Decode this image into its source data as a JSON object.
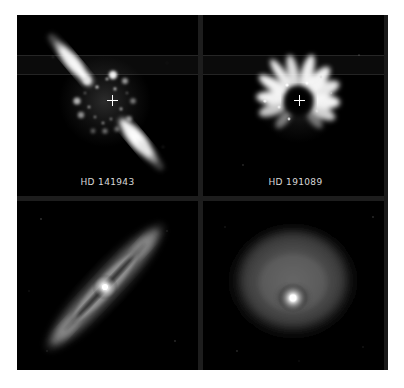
{
  "figure": {
    "background_color": "#000000",
    "page_color": "#ffffff",
    "gutter_color": "#1d1d1d",
    "marker_color": "#ffffff",
    "label_color": "#d8d8d8",
    "layout": "2x2 grid",
    "rows": 2,
    "columns": 2
  },
  "panels": [
    {
      "id": "top-left",
      "label": "HD 141943",
      "kind": "coronagraphic-observation",
      "has_center_marker": true,
      "marker": "plus",
      "description": "Scattered-light disk, edge-on-ish, oriented NE-SW diagonal with speckle halo",
      "disk_position_angle_deg": 45
    },
    {
      "id": "top-right",
      "label": "HD 191089",
      "kind": "coronagraphic-observation",
      "has_center_marker": true,
      "marker": "plus",
      "description": "Radial petal/spoke structure around occulted star",
      "disk_position_angle_deg": 0
    },
    {
      "id": "bottom-left",
      "label": "",
      "kind": "disk-model",
      "has_center_marker": false,
      "marker": "",
      "description": "Inclined model disk, elongated along NE-SW with bright central star",
      "disk_position_angle_deg": 45
    },
    {
      "id": "bottom-right",
      "label": "",
      "kind": "disk-model",
      "has_center_marker": false,
      "marker": "",
      "description": "Near face-on model disk, diffuse circular halo with bright central star",
      "disk_position_angle_deg": 0
    }
  ]
}
